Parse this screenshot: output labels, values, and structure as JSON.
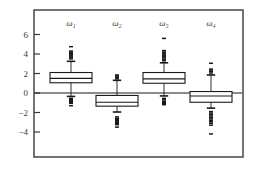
{
  "chart_data": {
    "type": "box",
    "title": "",
    "xlabel": "",
    "ylabel": "",
    "ylim": [
      -5.2,
      7.2
    ],
    "yticks": [
      6,
      4,
      2,
      0,
      -2,
      -4
    ],
    "ytick_labels": [
      "6",
      "4",
      "2",
      "0",
      "−2",
      "−4"
    ],
    "grid": false,
    "legend": "none",
    "zero_reference_line": 0,
    "frame": "box",
    "categories": [
      "ω₁",
      "ω₂",
      "ω₃",
      "ω₄"
    ],
    "boxes": [
      {
        "name": "ω₁",
        "label": "ω₁",
        "whisker_low": -0.35,
        "q1": 1.05,
        "median": 1.5,
        "q3": 2.1,
        "whisker_high": 3.25,
        "outliers_high": [
          3.5,
          3.6,
          3.7,
          3.8,
          3.9,
          4.0,
          4.05,
          4.1,
          4.2,
          4.3,
          4.75
        ],
        "outliers_low": [
          -0.55,
          -0.65,
          -0.75,
          -0.8,
          -0.9,
          -1.0,
          -1.05,
          -1.3
        ]
      },
      {
        "name": "ω₂",
        "label": "ω₂",
        "whisker_low": -1.95,
        "q1": -1.35,
        "median": -0.95,
        "q3": -0.25,
        "whisker_high": 1.3,
        "outliers_high": [
          1.45,
          1.55,
          1.65,
          1.75,
          1.85
        ],
        "outliers_low": [
          -2.45,
          -2.6,
          -2.7,
          -2.8,
          -2.9,
          -3.0,
          -3.1,
          -3.25,
          -3.5
        ]
      },
      {
        "name": "ω₃",
        "label": "ω₃",
        "whisker_low": -0.3,
        "q1": 1.0,
        "median": 1.45,
        "q3": 2.1,
        "whisker_high": 3.1,
        "outliers_high": [
          3.3,
          3.45,
          3.6,
          3.7,
          3.8,
          3.9,
          4.0,
          4.1,
          4.2,
          4.35,
          5.6
        ],
        "outliers_low": [
          -0.55,
          -0.7,
          -0.85,
          -0.95,
          -1.1,
          -1.2
        ]
      },
      {
        "name": "ω₄",
        "label": "ω₄",
        "whisker_low": -1.55,
        "q1": -0.95,
        "median": -0.3,
        "q3": 0.15,
        "whisker_high": 1.85,
        "outliers_high": [
          2.05,
          2.2,
          2.35,
          2.45,
          3.05
        ],
        "outliers_low": [
          -1.9,
          -2.05,
          -2.2,
          -2.35,
          -2.5,
          -2.65,
          -2.8,
          -2.95,
          -3.1,
          -3.3,
          -4.2
        ]
      }
    ]
  },
  "colors": {
    "frame": "#3a3a3a",
    "line": "#1a1a1a",
    "box_fill": "#ffffff",
    "background": "#ffffff"
  }
}
